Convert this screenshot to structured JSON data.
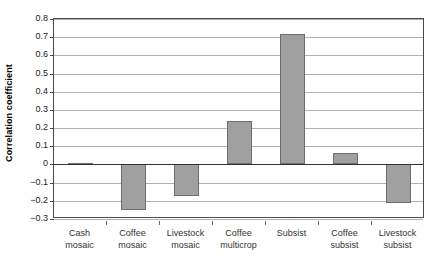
{
  "chart_data": {
    "type": "bar",
    "title": "",
    "xlabel": "",
    "ylabel": "Correlation coefficient",
    "ylim": [
      -0.3,
      0.8
    ],
    "ytick_step": 0.1,
    "grid": true,
    "legend": "none",
    "orientation": "vertical",
    "bar_color": "#a0a0a0",
    "bar_edge_color": "#6d6d6d",
    "categories": [
      "Cash mosaic",
      "Coffee mosaic",
      "Livestock mosaic",
      "Coffee multicrop",
      "Subsist",
      "Coffee subsist",
      "Livestock subsist"
    ],
    "category_lines": [
      [
        "Cash",
        "mosaic"
      ],
      [
        "Coffee",
        "mosaic"
      ],
      [
        "Livestock",
        "mosaic"
      ],
      [
        "Coffee",
        "multicrop"
      ],
      [
        "Subsist",
        ""
      ],
      [
        "Coffee",
        "subsist"
      ],
      [
        "Livestock",
        "subsist"
      ]
    ],
    "values": [
      0.01,
      -0.25,
      -0.175,
      0.24,
      0.72,
      0.065,
      -0.21
    ],
    "ytick_labels": [
      "0.8",
      "0.7",
      "0.6",
      "0.5",
      "0.4",
      "0.3",
      "0.2",
      "0.1",
      "0",
      "−0.1",
      "−0.2",
      "−0.3"
    ],
    "ytick_values": [
      0.8,
      0.7,
      0.6,
      0.5,
      0.4,
      0.3,
      0.2,
      0.1,
      0,
      -0.1,
      -0.2,
      -0.3
    ]
  }
}
